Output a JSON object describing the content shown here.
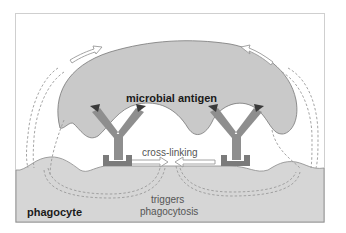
{
  "diagram": {
    "labels": {
      "antigen": "microbial antigen",
      "crosslinking": "cross-linking",
      "triggers_line1": "triggers",
      "triggers_line2": "phagocytosis",
      "cell": "phagocyte"
    },
    "colors": {
      "background": "#ffffff",
      "frame": "#c8c8c8",
      "microbe_fill": "#c9c9c9",
      "microbe_stroke": "#777777",
      "phagocyte_fill": "#d6d6d6",
      "antibody": "#8e8e8e",
      "receptor": "#7b7b7b",
      "antigen_dark": "#3a3a3a",
      "dashed": "#9a9a9a",
      "arrow_outline": "#9a9a9a"
    }
  }
}
